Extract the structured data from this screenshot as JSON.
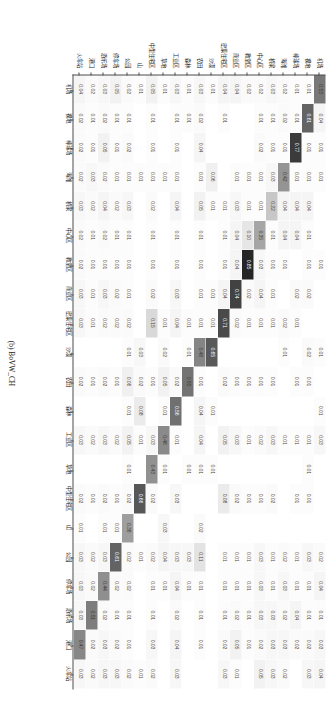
{
  "figure": {
    "caption": "(b) BoVW_CH",
    "type": "confusion-matrix"
  },
  "chart_data": {
    "type": "heatmap",
    "title": "(b) BoVW_CH",
    "xlabel": "",
    "ylabel": "",
    "grid": false,
    "legend": "none",
    "colormap": "greys",
    "zlim": [
      0,
      1
    ],
    "note": "Row-normalised confusion matrix; blank cells are 0.00",
    "categories": [
      "机场",
      "裸地",
      "棒球场",
      "海滩",
      "桥梁",
      "中心区",
      "教堂区",
      "商业区",
      "密集住宅区",
      "沙漠",
      "农田",
      "森林",
      "工业区",
      "草地",
      "中型住宅区",
      "山",
      "公园",
      "停车场",
      "游乐场",
      "港口",
      "火车站",
      "度假村",
      "河流",
      "学校",
      "稀疏住宅区",
      "广场",
      "体育场",
      "储罐",
      "网球场",
      "梯田",
      "高架桥"
    ],
    "x_categories": [
      "机场",
      "裸地",
      "棒球场",
      "海滩",
      "桥梁",
      "中心区",
      "教堂区",
      "商业区",
      "密集住宅区",
      "沙漠",
      "农田",
      "森林",
      "工业区",
      "草地",
      "中型住宅区",
      "山",
      "公园",
      "停车场",
      "游乐场",
      "港口",
      "火车站"
    ],
    "y_categories": [
      "机场",
      "裸地",
      "棒球场",
      "海滩",
      "桥梁",
      "中心区",
      "教堂区",
      "商业区",
      "密集住宅区",
      "沙漠",
      "农田",
      "森林",
      "工业区",
      "草地",
      "中型住宅区",
      "山",
      "公园",
      "停车场",
      "游乐场",
      "港口",
      "火车站"
    ],
    "ticks": {
      "x": [
        "0.0",
        "",
        "",
        "",
        "",
        "",
        "",
        "",
        "",
        "",
        "",
        "",
        "",
        "",
        "",
        "",
        "",
        "",
        "",
        "",
        "1.0"
      ],
      "y": []
    },
    "rows": [
      {
        "label": "机场",
        "values": [
          0.53,
          0.04,
          0.01,
          0.01,
          0.0,
          0.0,
          0.01,
          0.0,
          0.0,
          0.01,
          0.0,
          0.01,
          0.03,
          0.0,
          0.0,
          0.0,
          0.02,
          0.04,
          0.01,
          0.03,
          0.04
        ]
      },
      {
        "label": "裸地",
        "values": [
          0.01,
          0.61,
          0.01,
          0.01,
          0.04,
          0.01,
          0.01,
          0.02,
          0.0,
          0.02,
          0.01,
          0.0,
          0.01,
          0.01,
          0.01,
          0.0,
          0.03,
          0.01,
          0.01,
          0.02,
          0.03
        ]
      },
      {
        "label": "棒球场",
        "values": [
          0.01,
          0.01,
          0.77,
          0.01,
          0.04,
          0.04,
          0.0,
          0.02,
          0.01,
          0.0,
          0.01,
          0.0,
          0.01,
          0.0,
          0.01,
          0.0,
          0.01,
          0.01,
          0.04,
          0.02,
          0.0
        ]
      },
      {
        "label": "海滩",
        "values": [
          0.02,
          0.02,
          0.01,
          0.42,
          0.04,
          0.04,
          0.01,
          0.0,
          0.02,
          0.01,
          0.0,
          0.0,
          0.01,
          0.0,
          0.0,
          0.0,
          0.02,
          0.03,
          0.02,
          0.03,
          0.02
        ]
      },
      {
        "label": "桥梁",
        "values": [
          0.03,
          0.01,
          0.01,
          0.03,
          0.22,
          0.01,
          0.01,
          0.01,
          0.01,
          0.0,
          0.01,
          0.0,
          0.03,
          0.0,
          0.02,
          0.0,
          0.01,
          0.01,
          0.03,
          0.03,
          0.03
        ]
      },
      {
        "label": "中心区",
        "values": [
          0.02,
          0.01,
          0.02,
          0.01,
          0.01,
          0.35,
          0.03,
          0.04,
          0.01,
          0.0,
          0.01,
          0.0,
          0.02,
          0.0,
          0.01,
          0.0,
          0.03,
          0.03,
          0.03,
          0.02,
          0.05
        ]
      },
      {
        "label": "教堂区",
        "values": [
          0.02,
          0.0,
          0.0,
          0.01,
          0.01,
          0.1,
          0.85,
          0.02,
          0.01,
          0.0,
          0.01,
          0.0,
          0.01,
          0.0,
          0.01,
          0.0,
          0.01,
          0.01,
          0.01,
          0.01,
          0.0
        ]
      },
      {
        "label": "商业区",
        "values": [
          0.04,
          0.0,
          0.0,
          0.01,
          0.03,
          0.04,
          0.04,
          0.74,
          0.02,
          0.0,
          0.01,
          0.0,
          0.03,
          0.0,
          0.02,
          0.0,
          0.01,
          0.01,
          0.02,
          0.05,
          0.01
        ]
      },
      {
        "label": "密集住宅区",
        "values": [
          0.04,
          0.01,
          0.0,
          0.0,
          0.01,
          0.01,
          0.01,
          0.04,
          0.71,
          0.0,
          0.02,
          0.0,
          0.05,
          0.0,
          0.08,
          0.0,
          0.01,
          0.01,
          0.01,
          0.02,
          0.03
        ]
      },
      {
        "label": "沙漠",
        "values": [
          0.01,
          0.0,
          0.0,
          0.06,
          0.01,
          0.0,
          0.0,
          0.01,
          0.01,
          0.65,
          0.0,
          0.01,
          0.0,
          0.01,
          0.0,
          0.0,
          0.0,
          0.0,
          0.0,
          0.0,
          0.0
        ]
      },
      {
        "label": "农田",
        "values": [
          0.03,
          0.02,
          0.04,
          0.01,
          0.05,
          0.01,
          0.01,
          0.01,
          0.01,
          0.48,
          0.01,
          0.04,
          0.04,
          0.01,
          0.0,
          0.02,
          0.11,
          0.01,
          0.01,
          0.01,
          0.0
        ]
      },
      {
        "label": "森林",
        "values": [
          0.01,
          0.01,
          0.0,
          0.0,
          0.0,
          0.0,
          0.0,
          0.0,
          0.01,
          0.01,
          0.55,
          0.0,
          0.0,
          0.01,
          0.0,
          0.0,
          0.03,
          0.01,
          0.0,
          0.0,
          0.0
        ]
      },
      {
        "label": "工业区",
        "values": [
          0.03,
          0.01,
          0.01,
          0.01,
          0.04,
          0.01,
          0.01,
          0.03,
          0.04,
          0.0,
          0.02,
          0.56,
          0.01,
          0.0,
          0.03,
          0.0,
          0.03,
          0.04,
          0.02,
          0.04,
          0.03
        ]
      },
      {
        "label": "草地",
        "values": [
          0.01,
          0.0,
          0.0,
          0.01,
          0.0,
          0.0,
          0.0,
          0.0,
          0.01,
          0.02,
          0.05,
          0.01,
          0.46,
          0.01,
          0.0,
          0.03,
          0.04,
          0.01,
          0.0,
          0.0,
          0.0
        ]
      },
      {
        "label": "中型住宅区",
        "values": [
          0.05,
          0.01,
          0.01,
          0.01,
          0.02,
          0.01,
          0.01,
          0.02,
          0.15,
          0.0,
          0.01,
          0.0,
          0.03,
          0.43,
          0.02,
          0.0,
          0.02,
          0.01,
          0.01,
          0.03,
          0.02
        ]
      },
      {
        "label": "山",
        "values": [
          0.01,
          0.0,
          0.0,
          0.01,
          0.0,
          0.0,
          0.0,
          0.0,
          0.0,
          0.03,
          0.02,
          0.08,
          0.01,
          0.0,
          0.66,
          0.0,
          0.01,
          0.0,
          0.0,
          0.0,
          0.01
        ]
      },
      {
        "label": "公园",
        "values": [
          0.02,
          0.01,
          0.02,
          0.01,
          0.03,
          0.01,
          0.01,
          0.01,
          0.02,
          0.01,
          0.06,
          0.01,
          0.05,
          0.01,
          0.02,
          0.38,
          0.02,
          0.02,
          0.01,
          0.01,
          0.02
        ]
      },
      {
        "label": "停车场",
        "values": [
          0.05,
          0.01,
          0.01,
          0.01,
          0.02,
          0.01,
          0.01,
          0.02,
          0.02,
          0.0,
          0.01,
          0.0,
          0.02,
          0.0,
          0.01,
          0.01,
          0.61,
          0.02,
          0.01,
          0.02,
          0.03
        ]
      },
      {
        "label": "游乐场",
        "values": [
          0.03,
          0.02,
          0.05,
          0.02,
          0.04,
          0.02,
          0.01,
          0.03,
          0.02,
          0.0,
          0.02,
          0.0,
          0.03,
          0.0,
          0.02,
          0.01,
          0.03,
          0.44,
          0.02,
          0.03,
          0.03
        ]
      },
      {
        "label": "港口",
        "values": [
          0.02,
          0.01,
          0.01,
          0.03,
          0.02,
          0.01,
          0.01,
          0.01,
          0.01,
          0.0,
          0.01,
          0.0,
          0.02,
          0.0,
          0.01,
          0.0,
          0.02,
          0.02,
          0.51,
          0.02,
          0.02
        ]
      },
      {
        "label": "火车站",
        "values": [
          0.04,
          0.02,
          0.02,
          0.02,
          0.03,
          0.02,
          0.02,
          0.03,
          0.03,
          0.0,
          0.02,
          0.0,
          0.03,
          0.0,
          0.02,
          0.01,
          0.03,
          0.03,
          0.03,
          0.47,
          0.03
        ]
      }
    ]
  },
  "axis": {
    "x_first_tick": "0.0",
    "x_last_tick": "1.0"
  }
}
